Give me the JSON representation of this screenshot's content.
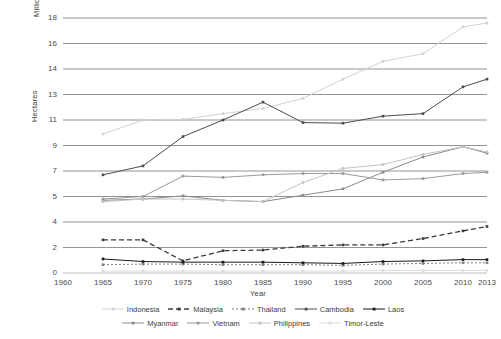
{
  "chart_data": {
    "type": "line",
    "title": "",
    "xlabel": "Year",
    "ylabel": "Hectares",
    "y_unit_label": "Millions",
    "x": [
      1965,
      1970,
      1975,
      1980,
      1985,
      1990,
      1995,
      2000,
      2005,
      2010,
      2013
    ],
    "x_ticks": [
      "1960",
      "1965",
      "1970",
      "1975",
      "1980",
      "1985",
      "1990",
      "1995",
      "2000",
      "2005",
      "2010",
      "2013"
    ],
    "y_ticks": [
      "18",
      "16",
      "14",
      "13",
      "11",
      "9",
      "7",
      "5",
      "4",
      "2",
      "0"
    ],
    "xlim": [
      1960,
      2013
    ],
    "ylim": [
      0,
      18
    ],
    "grid": "horizontal",
    "legend_position": "bottom",
    "series": [
      {
        "name": "Indonesia",
        "color": "#d2d2d2",
        "dash": "none",
        "marker": "square",
        "values": [
          9.9,
          11.0,
          11.05,
          11.5,
          11.9,
          12.7,
          13.6,
          14.6,
          15.2,
          17.3,
          17.6
        ]
      },
      {
        "name": "Malaysia",
        "color": "#3a3a3a",
        "dash": "dashed",
        "marker": "square",
        "values": [
          2.6,
          2.6,
          0.95,
          1.75,
          1.8,
          2.1,
          2.2,
          2.2,
          2.7,
          3.3,
          3.65
        ]
      },
      {
        "name": "Thailand",
        "color": "#7f7f7f",
        "dash": "dotted",
        "marker": "square",
        "values": [
          0.65,
          0.7,
          0.7,
          0.65,
          0.65,
          0.65,
          0.6,
          0.7,
          0.75,
          0.8,
          0.8
        ]
      },
      {
        "name": "Cambodia",
        "color": "#4c4c4c",
        "dash": "none",
        "marker": "square",
        "values": [
          6.7,
          7.4,
          9.7,
          11.0,
          12.4,
          10.8,
          10.75,
          11.3,
          11.5,
          13.3,
          13.6
        ]
      },
      {
        "name": "Laos",
        "color": "#1a1a1a",
        "dash": "none",
        "marker": "square",
        "values": [
          1.1,
          0.9,
          0.85,
          0.85,
          0.85,
          0.8,
          0.75,
          0.9,
          0.95,
          1.05,
          1.05
        ]
      },
      {
        "name": "Myanmar",
        "color": "#8a8a8a",
        "dash": "none",
        "marker": "square",
        "values": [
          4.85,
          4.9,
          5.05,
          4.85,
          4.8,
          5.1,
          5.6,
          6.9,
          8.1,
          8.9,
          8.4
        ]
      },
      {
        "name": "Vietnam",
        "color": "#9a9a9a",
        "dash": "none",
        "marker": "square",
        "values": [
          4.9,
          5.0,
          6.6,
          6.5,
          6.7,
          6.8,
          6.8,
          6.3,
          6.4,
          6.8,
          6.9
        ]
      },
      {
        "name": "Philippines",
        "color": "#c4c4c4",
        "dash": "none",
        "marker": "square",
        "values": [
          4.8,
          4.9,
          4.9,
          4.85,
          4.8,
          6.1,
          7.2,
          7.5,
          8.3,
          8.9,
          8.5
        ]
      },
      {
        "name": "Timor-Leste",
        "color": "#dcdcdc",
        "dash": "none",
        "marker": "square",
        "values": [
          0.15,
          0.15,
          0.15,
          0.15,
          0.15,
          0.15,
          0.15,
          0.2,
          0.2,
          0.2,
          0.2
        ]
      }
    ]
  },
  "axes": {
    "unit_label": "Millions",
    "y_label": "Hectares",
    "x_label": "Year"
  }
}
